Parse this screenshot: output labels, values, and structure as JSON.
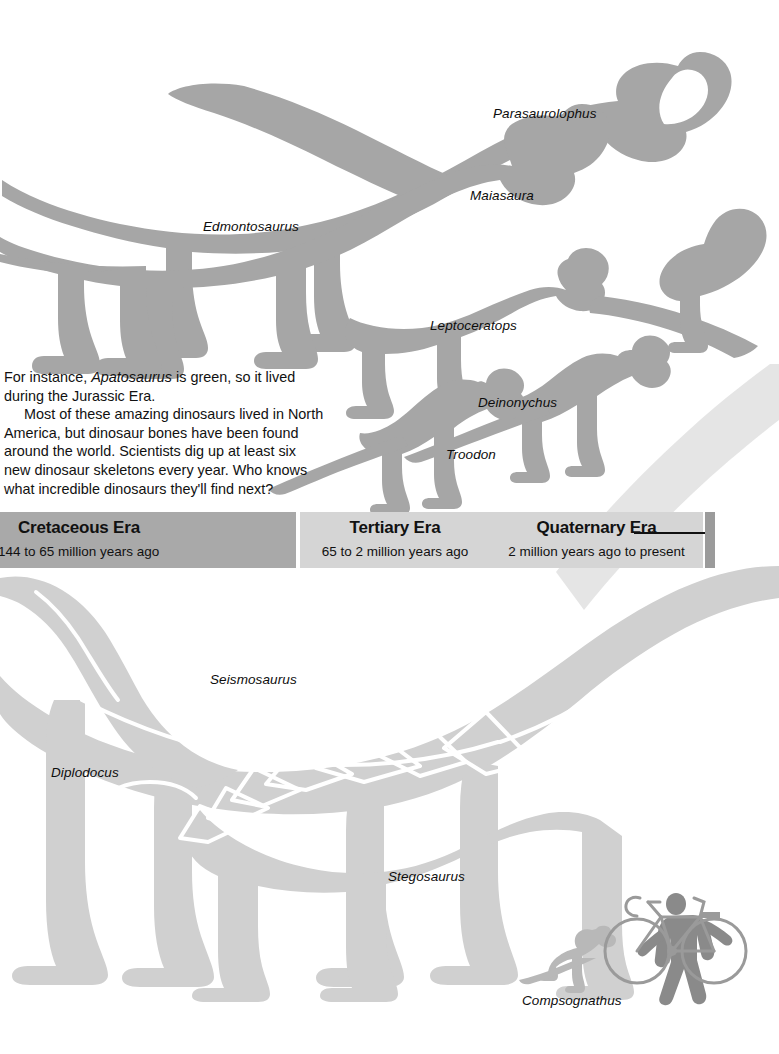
{
  "page": {
    "background_color": "#ffffff",
    "width": 779,
    "height": 1054
  },
  "palette": {
    "upper_silhouette": "#a6a6a6",
    "lower_silhouette": "#d0d0d0",
    "human_bike": "#8a8a8a",
    "cretaceous_band": "#a9a9a9",
    "tertiary_band": "#d5d5d5",
    "quaternary_band": "#d5d5d5",
    "band_endcap": "#9b9b9b",
    "text": "#111111"
  },
  "body_text": {
    "paragraph_1": "For instance, Apatosaurus is green, so it lived during the Jurassic Era.",
    "paragraph_1_lead": "For instance, ",
    "paragraph_1_italic": "Apatosaurus",
    "paragraph_1_tail": " is green, so it lived during the Jurassic Era.",
    "paragraph_2": "Most of these amazing dinosaurs lived in North America, but dinosaur bones have been found around the world. Scientists dig up at least six new dinosaur skeletons every year. Who knows what incredible dinosaurs they'll find next?"
  },
  "timeline": {
    "eras": [
      {
        "id": "cretaceous",
        "title": "Cretaceous Era",
        "range": "144 to 65 million years ago"
      },
      {
        "id": "tertiary",
        "title": "Tertiary Era",
        "range": "65 to 2 million years ago"
      },
      {
        "id": "quaternary",
        "title": "Quaternary Era",
        "range": "2 million years ago to present"
      }
    ]
  },
  "dinosaur_labels": {
    "upper": [
      {
        "name": "Parasaurolophus",
        "x": 493,
        "y": 106
      },
      {
        "name": "Maiasaura",
        "x": 470,
        "y": 188
      },
      {
        "name": "Edmontosaurus",
        "x": 203,
        "y": 219
      },
      {
        "name": "Leptoceratops",
        "x": 430,
        "y": 318
      },
      {
        "name": "Deinonychus",
        "x": 478,
        "y": 395
      },
      {
        "name": "Troodon",
        "x": 446,
        "y": 447
      }
    ],
    "lower": [
      {
        "name": "Seismosaurus",
        "x": 210,
        "y": 672
      },
      {
        "name": "Diplodocus",
        "x": 51,
        "y": 765
      },
      {
        "name": "Stegosaurus",
        "x": 388,
        "y": 869
      },
      {
        "name": "Compsognathus",
        "x": 522,
        "y": 993
      }
    ]
  }
}
